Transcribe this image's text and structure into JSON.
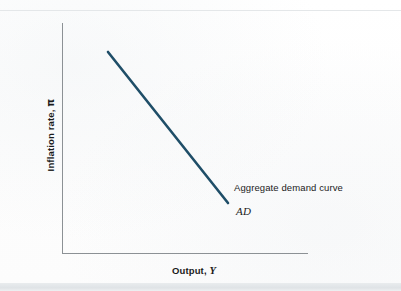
{
  "figure": {
    "background_color": "#fdfdfd",
    "axis_color": "#8c9195",
    "curve_color": "#1f4e68",
    "text_color": "#1b1b1b"
  },
  "axes": {
    "y_title_prefix": "Inflation rate, ",
    "y_title_symbol": "π",
    "x_title_prefix": "Output, ",
    "x_title_symbol": "Y"
  },
  "annotations": {
    "curve_name": "Aggregate demand curve",
    "curve_symbol": "AD"
  },
  "chart_data": {
    "type": "line",
    "title": "",
    "subtitle": "",
    "xlabel": "Output, Y",
    "ylabel": "Inflation rate, π",
    "xlim": [
      0,
      1
    ],
    "ylim": [
      0,
      1
    ],
    "grid": false,
    "legend_position": "inline-annotation",
    "axis_ticks": {
      "x": [],
      "y": []
    },
    "series": [
      {
        "name": "Aggregate demand curve",
        "symbol": "AD",
        "color": "#1f4e68",
        "line_width": 2.6,
        "x": [
          0.187,
          0.675
        ],
        "y": [
          0.874,
          0.217
        ],
        "pixel_start": [
          108,
          52
        ],
        "pixel_end": [
          228,
          203
        ],
        "description": "Downward-sloping straight aggregate demand curve: higher inflation is associated with lower output."
      }
    ],
    "annotations": [
      {
        "text": "Aggregate demand curve",
        "pixel": [
          234,
          188
        ],
        "style": "regular"
      },
      {
        "text": "AD",
        "pixel": [
          237,
          212
        ],
        "style": "italic"
      }
    ]
  }
}
